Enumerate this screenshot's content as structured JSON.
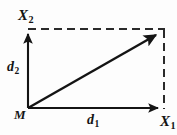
{
  "figure": {
    "background_color": "#fdfdfd",
    "stroke_color": "#141414",
    "labels": {
      "axis_vertical": {
        "base": "X",
        "sub": "2"
      },
      "axis_horizontal": {
        "base": "X",
        "sub": "1"
      },
      "origin": {
        "base": "M",
        "sub": ""
      },
      "component_vertical": {
        "base": "d",
        "sub": "2"
      },
      "component_horizontal": {
        "base": "d",
        "sub": "1"
      }
    },
    "geometry": {
      "origin": [
        28,
        108
      ],
      "x_axis_tip": [
        163,
        108
      ],
      "y_axis_tip": [
        28,
        29
      ],
      "corner": [
        163,
        30
      ],
      "resultant_tip": [
        162,
        31
      ],
      "dash_pattern": "8 5"
    }
  }
}
